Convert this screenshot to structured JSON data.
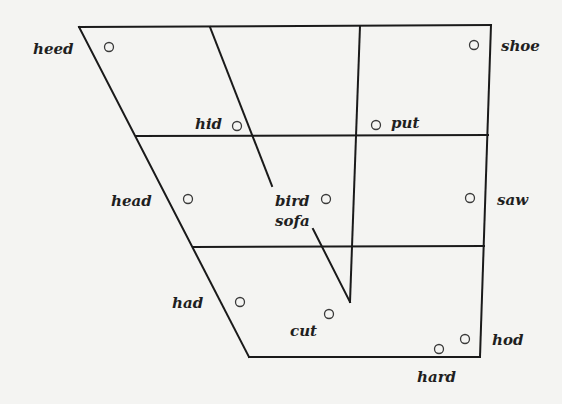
{
  "diagram": {
    "type": "vowel-quadrilateral",
    "vowels": [
      {
        "word": "heed"
      },
      {
        "word": "hid"
      },
      {
        "word": "head"
      },
      {
        "word": "had"
      },
      {
        "word": "bird"
      },
      {
        "word": "sofa"
      },
      {
        "word": "cut"
      },
      {
        "word": "put"
      },
      {
        "word": "shoe"
      },
      {
        "word": "saw"
      },
      {
        "word": "hod"
      },
      {
        "word": "hard"
      }
    ]
  }
}
